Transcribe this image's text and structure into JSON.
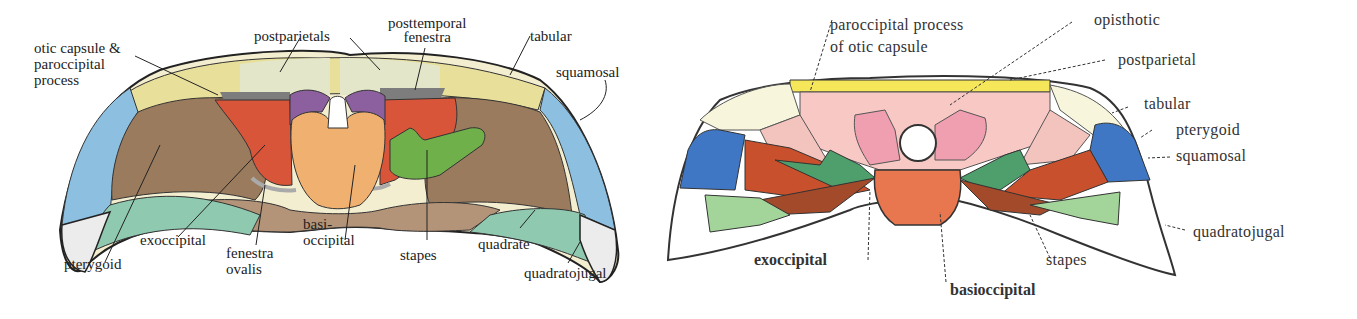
{
  "left_diagram": {
    "colors": {
      "tabular_postparietal": "#efe7a6",
      "postparietal_light": "#e6e8cc",
      "squamosal": "#8dbfe0",
      "exoccipital": "#9b7b5e",
      "exoccipital_lower": "#b49478",
      "pterygoid": "#8fc9b0",
      "quadratojugal": "#ececec",
      "otic_red": "#d9553a",
      "purple": "#8c5f9e",
      "basioccipital": "#f0b070",
      "stapes": "#6fb04a",
      "fenestra_grey": "#7d7d7d"
    },
    "labels": {
      "otic_capsule_1": "otic capsule &",
      "otic_capsule_2": "paroccipital",
      "otic_capsule_3": "process",
      "postparietals": "postparietals",
      "posttemporal_1": "posttemporal",
      "posttemporal_2": "fenestra",
      "tabular": "tabular",
      "squamosal": "squamosal",
      "pterygoid": "pterygoid",
      "exoccipital": "exoccipital",
      "fenestra_1": "fenestra",
      "fenestra_2": "ovalis",
      "basi_1": "basi-",
      "basi_2": "occipital",
      "stapes": "stapes",
      "quadrate": "quadrate",
      "quadratojugal": "quadratojugal"
    }
  },
  "right_diagram": {
    "colors": {
      "postparietal": "#f5e65a",
      "tabular": "#f7f6dc",
      "opisthotic": "#f8c9c4",
      "paroccipital": "#ef9fb0",
      "squamosal": "#3f77c4",
      "pterygoid_red": "#c8502c",
      "stapes_brown": "#a24a2a",
      "exoccipital_green": "#4f9f6c",
      "quadrate_green": "#a3d49a",
      "basioccipital": "#e8764e",
      "quadratojugal": "#ffffff"
    },
    "labels": {
      "paroccipital_1": "paroccipital process",
      "paroccipital_2": "of otic capsule",
      "opisthotic": "opisthotic",
      "postparietal": "postparietal",
      "tabular": "tabular",
      "pterygoid": "pterygoid",
      "squamosal": "squamosal",
      "quadratojugal": "quadratojugal",
      "exoccipital": "exoccipital",
      "stapes": "stapes",
      "basioccipital": "basioccipital"
    }
  }
}
